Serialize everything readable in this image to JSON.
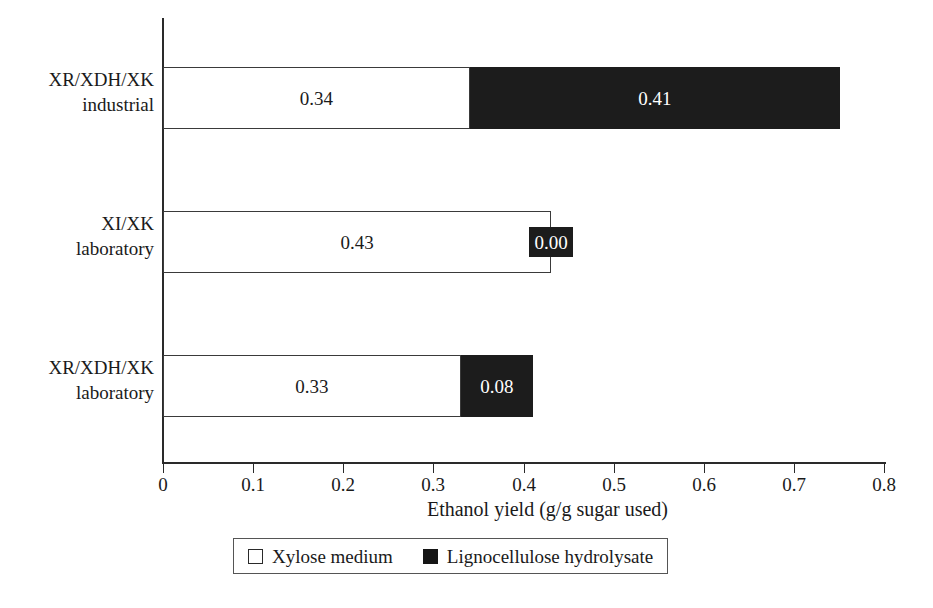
{
  "chart_data": {
    "type": "bar",
    "orientation": "horizontal",
    "stacked": true,
    "title": "",
    "xlabel": "Ethanol yield (g/g sugar used)",
    "ylabel": "",
    "xlim": [
      0,
      0.8
    ],
    "xticks": [
      "0",
      "0.1",
      "0.2",
      "0.3",
      "0.4",
      "0.5",
      "0.6",
      "0.7",
      "0.8"
    ],
    "xtick_values": [
      0,
      0.1,
      0.2,
      0.3,
      0.4,
      0.5,
      0.6,
      0.7,
      0.8
    ],
    "grid": false,
    "legend_position": "bottom",
    "categories": [
      "XR/XDH/XK industrial",
      "XI/XK laboratory",
      "XR/XDH/XK laboratory"
    ],
    "category_lines": [
      [
        "XR/XDH/XK",
        "industrial"
      ],
      [
        "XI/XK",
        "laboratory"
      ],
      [
        "XR/XDH/XK",
        "laboratory"
      ]
    ],
    "series": [
      {
        "name": "Xylose medium",
        "color": "#ffffff",
        "values": [
          0.34,
          0.43,
          0.33
        ],
        "labels": [
          "0.34",
          "0.43",
          "0.33"
        ]
      },
      {
        "name": "Lignocellulose hydrolysate",
        "color": "#1c1c1c",
        "values": [
          0.41,
          0.0,
          0.08
        ],
        "labels": [
          "0.41",
          "0.00",
          "0.08"
        ]
      }
    ],
    "totals": [
      0.75,
      0.43,
      0.41
    ]
  },
  "legend": {
    "items": [
      {
        "label": "Xylose medium",
        "swatch": "open-square-swatch"
      },
      {
        "label": "Lignocellulose hydrolysate",
        "swatch": "filled-square-swatch"
      }
    ]
  },
  "colors": {
    "series_light": "#ffffff",
    "series_dark": "#1c1c1c",
    "axis": "#2a2a2a",
    "text": "#1a1a1a",
    "background": "#ffffff"
  }
}
